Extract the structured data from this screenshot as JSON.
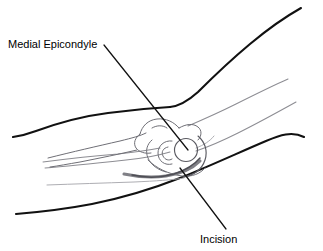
{
  "figure": {
    "background_color": "#ffffff",
    "width": 323,
    "height": 251
  },
  "labels": [
    {
      "id": "medial-epicondyle",
      "text": "Medial Epicondyle",
      "x": 8,
      "y": 48,
      "anchor": "start",
      "leader": {
        "from_x": 104,
        "from_y": 45,
        "to_x": 188,
        "to_y": 150
      }
    },
    {
      "id": "incision",
      "text": "Incision",
      "x": 200,
      "y": 243,
      "anchor": "start",
      "leader": {
        "from_x": 226,
        "from_y": 229,
        "to_x": 180,
        "to_y": 168
      }
    }
  ],
  "colors": {
    "skin_outline": "#111111",
    "contour_line": "#8d8d93",
    "contour_line_faint": "#a9a9ae",
    "bone_line": "#6f6f76",
    "incision_mark": "#808086",
    "label_text": "#000000",
    "background": "#ffffff"
  },
  "strokes": {
    "skin_outline_width": 2.1,
    "contour_width": 1.05,
    "bone_width": 1.0,
    "incision_width": 3.1,
    "leader_width": 1.25
  },
  "anatomy": {
    "upper_arm_outline_label": "posterior upper arm contour",
    "forearm_outline_label": "posterior forearm contour",
    "epicondyle_marker_label": "medial epicondyle prominence",
    "incision_label": "curved posteromedial skin incision"
  }
}
